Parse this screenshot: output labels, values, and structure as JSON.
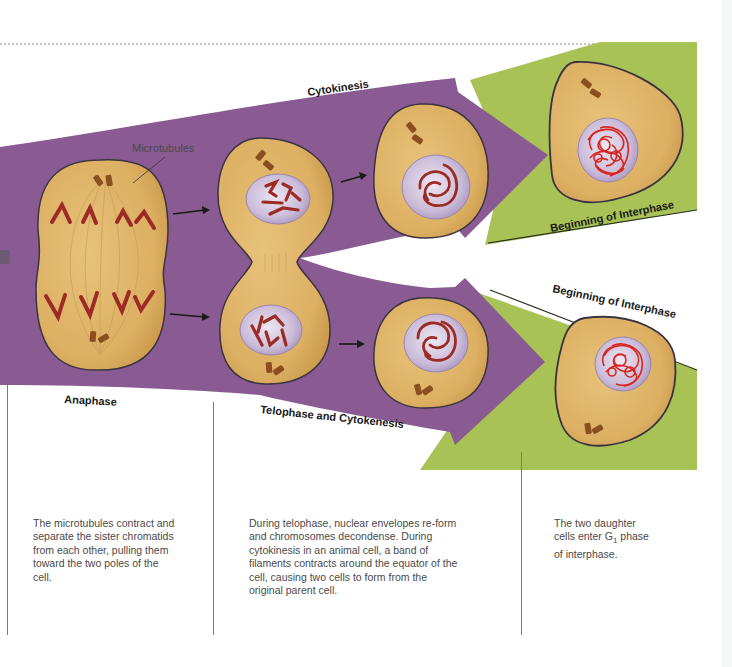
{
  "figure": {
    "title_hidden": "Cell division: anaphase to beginning of interphase",
    "colors": {
      "purple_band": "#8a5a93",
      "green_band": "#a9c255",
      "cytoplasm": "#e2b668",
      "cytoplasm_edge": "#3b3340",
      "nucleus": "#c9b8d6",
      "chromosome": "#9c2a25",
      "chromatin": "#d8261f",
      "centriole": "#8b4e1f"
    }
  },
  "labels": {
    "microtubules": "Microtubules",
    "cytokinesis": "Cytokinesis",
    "beginning_interphase_top": "Beginning of Interphase",
    "beginning_interphase_bottom": "Beginning of Interphase",
    "anaphase": "Anaphase",
    "telophase_cytokinesis": "Telophase and Cytokenesis"
  },
  "descriptions": {
    "anaphase": [
      "The microtubules contract and",
      "separate the sister chromatids",
      "from each other, pulling them",
      "toward the two poles of the",
      "cell."
    ],
    "telophase": [
      "During telophase, nuclear envelopes re-form",
      "and chromosomes decondense. During",
      "cytokinesis in an animal cell, a band of",
      "filaments contracts around the equator of the",
      "cell, causing two cells to form from the",
      "original parent cell."
    ],
    "interphase": {
      "line1": "The two daughter",
      "line2_pre": "cells enter G",
      "line2_sub": "1",
      "line2_post": " phase",
      "line3": "of interphase."
    }
  },
  "stages": [
    {
      "name": "Anaphase",
      "cells": 1
    },
    {
      "name": "Telophase",
      "cells": 1
    },
    {
      "name": "Cytokinesis",
      "cells": 2
    },
    {
      "name": "Beginning of Interphase",
      "cells": 2
    }
  ]
}
